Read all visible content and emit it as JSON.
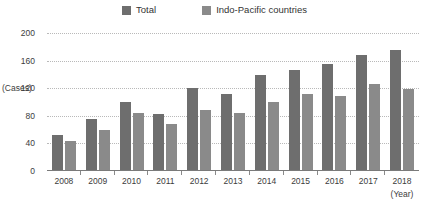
{
  "chart_data": {
    "type": "bar",
    "title": "",
    "xlabel": "(Year)",
    "ylabel": "(Cases)",
    "ylim": [
      0,
      200
    ],
    "yticks": [
      0,
      40,
      80,
      120,
      160,
      200
    ],
    "grid": true,
    "legend_position": "top-center",
    "categories": [
      "2008",
      "2009",
      "2010",
      "2011",
      "2012",
      "2013",
      "2014",
      "2015",
      "2016",
      "2017",
      "2018"
    ],
    "series": [
      {
        "name": "Total",
        "color": "#6e6e6e",
        "values": [
          52,
          76,
          100,
          83,
          121,
          112,
          139,
          146,
          155,
          168,
          175
        ]
      },
      {
        "name": "Indo-Pacific countries",
        "color": "#8a8a8a",
        "values": [
          43,
          60,
          84,
          68,
          89,
          84,
          100,
          112,
          108,
          126,
          119
        ]
      }
    ]
  },
  "axes": {
    "y_unit_label": "(Cases)",
    "x_unit_label": "(Year)"
  }
}
